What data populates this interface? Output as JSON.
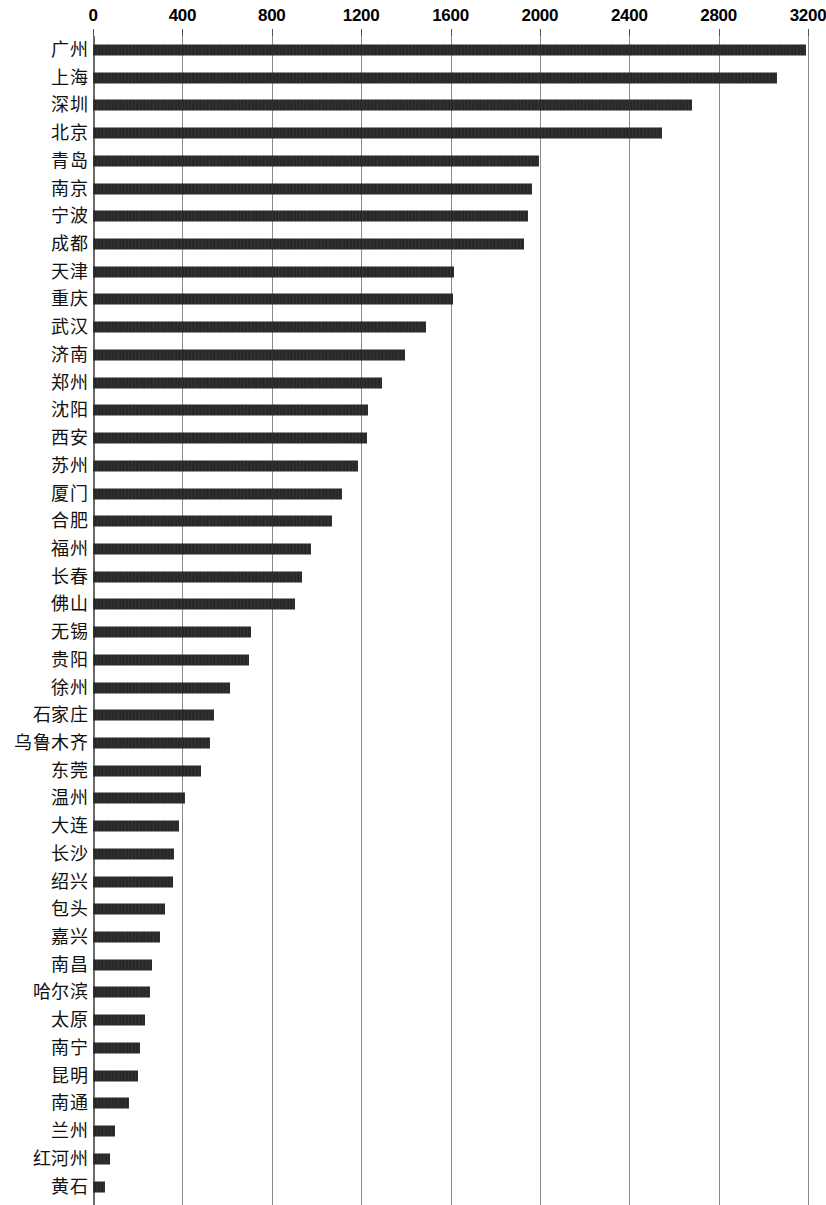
{
  "chart_data": {
    "type": "bar",
    "orientation": "horizontal",
    "title": "",
    "subtitle": "",
    "xlabel": "",
    "ylabel": "",
    "xlim": [
      0,
      3200
    ],
    "xticks": [
      0,
      400,
      800,
      1200,
      1600,
      2000,
      2400,
      2800,
      3200
    ],
    "xtick_labels": [
      "0",
      "400",
      "800",
      "1200",
      "1600",
      "2000",
      "2400",
      "2800",
      "3200"
    ],
    "grid": "vertical",
    "legend": "none",
    "bar_color": "#232323",
    "gridline_color": "#8a8a8a",
    "categories": [
      "广州",
      "上海",
      "深圳",
      "北京",
      "青岛",
      "南京",
      "宁波",
      "成都",
      "天津",
      "重庆",
      "武汉",
      "济南",
      "郑州",
      "沈阳",
      "西安",
      "苏州",
      "厦门",
      "合肥",
      "福州",
      "长春",
      "佛山",
      "无锡",
      "贵阳",
      "徐州",
      "石家庄",
      "乌鲁木齐",
      "东莞",
      "温州",
      "大连",
      "长沙",
      "绍兴",
      "包头",
      "嘉兴",
      "南昌",
      "哈尔滨",
      "太原",
      "南宁",
      "昆明",
      "南通",
      "兰州",
      "红河州",
      "黄石"
    ],
    "values": [
      3192,
      3060,
      2680,
      2545,
      1995,
      1965,
      1945,
      1930,
      1615,
      1610,
      1490,
      1395,
      1295,
      1230,
      1225,
      1185,
      1115,
      1070,
      975,
      935,
      905,
      707,
      697,
      612,
      540,
      523,
      482,
      412,
      385,
      363,
      357,
      322,
      300,
      263,
      255,
      232,
      212,
      202,
      162,
      97,
      78,
      53
    ]
  }
}
